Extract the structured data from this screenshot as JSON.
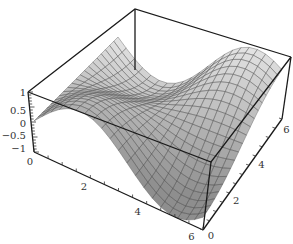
{
  "chart_data": {
    "type": "surface3d",
    "title": "",
    "function_hint": "z = sin(x)·cos(y)-like wave surface",
    "x_axis": {
      "label": "",
      "ticks": [
        "0",
        "2",
        "4",
        "6"
      ],
      "range": [
        0,
        6.28
      ]
    },
    "y_axis": {
      "label": "",
      "ticks": [
        "0",
        "2",
        "4",
        "6"
      ],
      "range": [
        0,
        6.28
      ]
    },
    "z_axis": {
      "label": "",
      "ticks": [
        "1",
        "0.5",
        "0",
        "−0.5",
        "−1"
      ],
      "range": [
        -1,
        1
      ]
    },
    "grid": false,
    "box": true,
    "mesh_resolution": 20,
    "colors": {
      "surface_dark": "#3a3a3a",
      "surface_light": "#f2f2f2",
      "mesh": "#555555",
      "box": "#1a1a1a"
    }
  },
  "labels": {
    "z": [
      "1",
      "0.5",
      "0",
      "−0.5",
      "−1"
    ],
    "x": [
      "0",
      "2",
      "4",
      "6"
    ],
    "y": [
      "0",
      "2",
      "4",
      "6"
    ]
  }
}
